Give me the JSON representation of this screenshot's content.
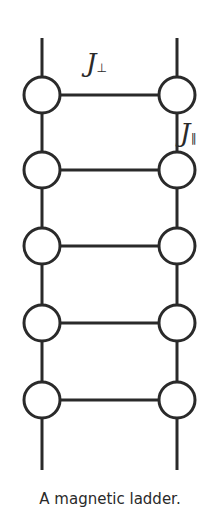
{
  "caption": "A magnetic ladder.",
  "labels": {
    "j_perp": {
      "symbol": "J",
      "subscript": "⊥"
    },
    "j_par": {
      "symbol": "J",
      "subscript": "∥"
    }
  },
  "diagram": {
    "rails_x": [
      42,
      177
    ],
    "rail_top": 38,
    "rail_bottom": 470,
    "node_y": [
      95,
      170,
      246,
      323,
      400
    ],
    "node_radius": 18,
    "stroke": "#2a2a2a"
  }
}
